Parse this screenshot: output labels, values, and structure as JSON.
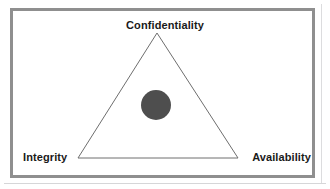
{
  "diagram": {
    "shape": "triangle",
    "background_color": "#ffffff",
    "frame": {
      "border_color": "#8f8f8f",
      "border_width_px": 3,
      "fill_color": "#ffffff"
    },
    "triangle": {
      "stroke_color": "#6e6e6e",
      "stroke_width_px": 1,
      "fill": "none",
      "apex": {
        "x": 157,
        "y": 33
      },
      "bottom_left": {
        "x": 78,
        "y": 158
      },
      "bottom_right": {
        "x": 238,
        "y": 158
      }
    },
    "center_marker": {
      "name": "center-dot",
      "shape": "circle",
      "color": "#4e4e4e",
      "center": {
        "x": 156,
        "y": 105
      },
      "radius_px": 15
    },
    "vertices": [
      {
        "id": "confidentiality",
        "label": "Confidentiality",
        "position": "top"
      },
      {
        "id": "integrity",
        "label": "Integrity",
        "position": "bottom-left"
      },
      {
        "id": "availability",
        "label": "Availability",
        "position": "bottom-right"
      }
    ]
  }
}
